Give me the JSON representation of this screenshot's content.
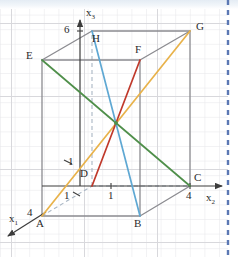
{
  "figure": {
    "background": "#ffffff",
    "grid": {
      "visible": true,
      "spacing_px": 14.6,
      "color": "#e3e3e6",
      "major_color": "#d6d6da"
    },
    "page_edge": {
      "style": "dashed",
      "color": "#5b78b4",
      "x_px": 228
    },
    "top_tint_color": "#e4ecf4"
  },
  "axes": [
    {
      "id": "x1",
      "label": "x",
      "sub": "1",
      "tick_label": "4",
      "tick_value": 4,
      "label_x": 10,
      "label_y": 219,
      "tick_x": 29,
      "tick_y": 215,
      "from": [
        42,
        216
      ],
      "to": [
        4,
        240
      ],
      "arrow": true,
      "color": "#4a4a4a"
    },
    {
      "id": "x2",
      "label": "x",
      "sub": "2",
      "tick_label": "4",
      "tick_value": 4,
      "label_x": 208,
      "label_y": 198,
      "tick_x": 188,
      "tick_y": 198,
      "from": [
        42,
        186
      ],
      "to": [
        224,
        186
      ],
      "arrow": true,
      "color": "#4a4a4a"
    },
    {
      "id": "x3",
      "label": "x",
      "sub": "3",
      "tick_label": "6",
      "tick_value": 6,
      "label_x": 88,
      "label_y": 12,
      "tick_x": 69,
      "tick_y": 31,
      "from": [
        80,
        186
      ],
      "to": [
        80,
        16
      ],
      "arrow": true,
      "color": "#4a4a4a"
    }
  ],
  "unit_ticks": [
    {
      "axis": "x1",
      "label": "1",
      "x": 68,
      "y": 162
    },
    {
      "axis": "x1",
      "label": "1",
      "x": 67,
      "y": 196
    },
    {
      "axis": "x2",
      "label": "1",
      "x": 111,
      "y": 196
    }
  ],
  "vertices": [
    {
      "name": "A",
      "x": 42,
      "y": 216,
      "label_x": 36,
      "label_y": 224
    },
    {
      "name": "B",
      "x": 140,
      "y": 216,
      "label_x": 135,
      "label_y": 224
    },
    {
      "name": "C",
      "x": 190,
      "y": 186,
      "label_x": 195,
      "label_y": 178
    },
    {
      "name": "D",
      "x": 92,
      "y": 186,
      "label_x": 81,
      "label_y": 174
    },
    {
      "name": "E",
      "x": 42,
      "y": 60,
      "label_x": 27,
      "label_y": 55
    },
    {
      "name": "F",
      "x": 140,
      "y": 60,
      "label_x": 136,
      "label_y": 49
    },
    {
      "name": "G",
      "x": 190,
      "y": 31,
      "label_x": 196,
      "label_y": 26
    },
    {
      "name": "H",
      "x": 92,
      "y": 31,
      "label_x": 93,
      "label_y": 38
    }
  ],
  "edges": {
    "solid_color": "#8b8b90",
    "hidden_color": "#a9b6c4",
    "solid": [
      [
        "A",
        "B"
      ],
      [
        "B",
        "C"
      ],
      [
        "C",
        "G"
      ],
      [
        "G",
        "F"
      ],
      [
        "F",
        "E"
      ],
      [
        "E",
        "A"
      ],
      [
        "E",
        "H"
      ],
      [
        "H",
        "G"
      ],
      [
        "B",
        "F"
      ],
      [
        "H",
        "x3top"
      ]
    ],
    "hidden": [
      [
        "A",
        "D"
      ],
      [
        "D",
        "C"
      ],
      [
        "D",
        "H"
      ]
    ]
  },
  "diagonals": [
    {
      "id": "EC",
      "from": "E",
      "to": "C",
      "color": "#4f8f4a",
      "label": "green-diagonal"
    },
    {
      "id": "AG",
      "from": "A",
      "to": "G",
      "color": "#e8b24a",
      "label": "gold-diagonal"
    },
    {
      "id": "DF",
      "from": "D",
      "to": "F",
      "color": "#c0392b",
      "label": "red-diagonal"
    },
    {
      "id": "HB",
      "from": "H",
      "to": "B",
      "color": "#5fa8d3",
      "label": "blue-diagonal"
    }
  ],
  "center": {
    "x": 116,
    "y": 123,
    "color": "#4f8f4a"
  }
}
